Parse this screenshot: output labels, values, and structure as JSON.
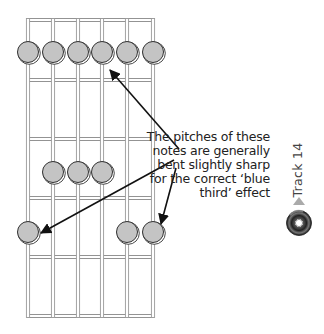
{
  "fretboard": {
    "strings": [
      28,
      53,
      78,
      102,
      127,
      153
    ],
    "nut_y": 20,
    "frets_y": [
      80,
      139,
      198,
      257,
      316
    ],
    "fret_color": "#888888",
    "string_color": "#999999",
    "dot_fill": "#c4c4c4",
    "dot_stroke": "#333333",
    "dot_radius": 10.5,
    "dots": [
      {
        "string": 1,
        "y": 52,
        "bent": false
      },
      {
        "string": 2,
        "y": 52,
        "bent": false
      },
      {
        "string": 3,
        "y": 52,
        "bent": false
      },
      {
        "string": 4,
        "y": 52,
        "bent": true
      },
      {
        "string": 5,
        "y": 52,
        "bent": false
      },
      {
        "string": 6,
        "y": 52,
        "bent": false
      },
      {
        "string": 2,
        "y": 172,
        "bent": false
      },
      {
        "string": 3,
        "y": 172,
        "bent": false
      },
      {
        "string": 4,
        "y": 172,
        "bent": false
      },
      {
        "string": 1,
        "y": 232,
        "bent": true
      },
      {
        "string": 5,
        "y": 232,
        "bent": false
      },
      {
        "string": 6,
        "y": 232,
        "bent": true
      }
    ]
  },
  "arrows": [
    {
      "from": [
        179,
        149
      ],
      "to": [
        110,
        70
      ]
    },
    {
      "from": [
        174,
        160
      ],
      "to": [
        41,
        233
      ]
    },
    {
      "from": [
        176,
        168
      ],
      "to": [
        161,
        224
      ]
    }
  ],
  "caption": {
    "lines": [
      "The pitches of these",
      "notes are generally",
      "bent slightly sharp",
      "for the correct ‘blue",
      "third’ effect"
    ]
  },
  "track": {
    "label": "Track 14",
    "icon": "cd-icon",
    "pointer_icon": "triangle-up-icon",
    "pointer_color": "#aaaaaa"
  }
}
